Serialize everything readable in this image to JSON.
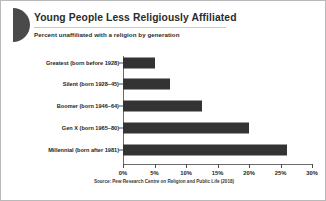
{
  "header": {
    "title": "Young People Less Religiously Affiliated",
    "subtitle": "Percent unaffiliated with a religion by generation",
    "decoration_icon": "half-circle-icon",
    "decoration_color": "#4a4a4a"
  },
  "footer": {
    "source": "Source: Pew Research Centre on Religion and Public Life (2018)"
  },
  "chart_data": {
    "type": "bar",
    "orientation": "horizontal",
    "title": "Young People Less Religiously Affiliated",
    "subtitle": "Percent unaffiliated with a religion by generation",
    "categories": [
      "Greatest (born before 1928)",
      "Silent (born 1928–45)",
      "Boomer (born 1946–64)",
      "Gen X (born 1965–80)",
      "Millennial (born after 1981)"
    ],
    "values": [
      5,
      7.5,
      12.5,
      20,
      26
    ],
    "xlabel": "",
    "ylabel": "",
    "xlim": [
      0,
      30
    ],
    "xticks": [
      0,
      5,
      10,
      15,
      20,
      25,
      30
    ],
    "xtick_labels": [
      "0%",
      "5%",
      "10%",
      "15%",
      "20%",
      "25%",
      "30%"
    ],
    "grid": false,
    "legend": false,
    "bar_color": "#333333",
    "axis_color": "#6b6b6b",
    "background": "#ffffff"
  }
}
